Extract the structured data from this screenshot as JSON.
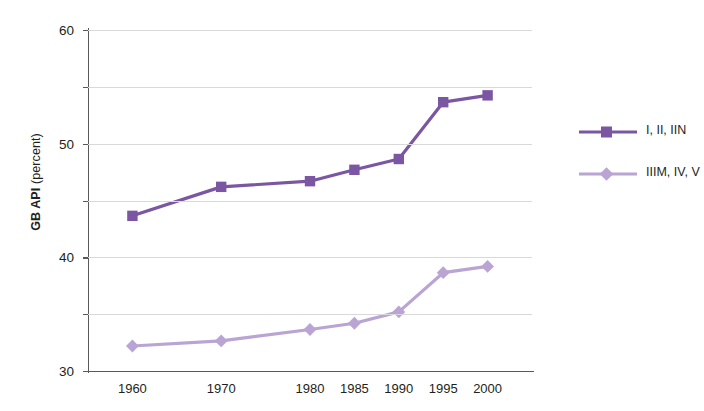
{
  "chart_data": {
    "type": "line",
    "title": "",
    "xlabel": "",
    "ylabel": "GB API (percent)",
    "ylabel_bold_part": "GB API",
    "ylabel_regular_part": " (percent)",
    "categories": [
      "1960",
      "1970",
      "1980",
      "1985",
      "1990",
      "1995",
      "2000"
    ],
    "x": [
      1960,
      1970,
      1980,
      1985,
      1990,
      1995,
      2000
    ],
    "xlim": [
      1955,
      2005
    ],
    "ylim": [
      0,
      60
    ],
    "yticks": [
      0,
      10,
      20,
      30,
      40,
      50,
      60
    ],
    "ytick_labels": [
      "0",
      "10",
      "20",
      "30",
      "40",
      "50",
      "60"
    ],
    "grid": "horizontal",
    "legend_position": "right",
    "series": [
      {
        "name": "I, II, IIN",
        "color": "#7a56a3",
        "marker": "square",
        "values": [
          27.3,
          32.4,
          33.4,
          35.4,
          37.3,
          47.3,
          48.5
        ]
      },
      {
        "name": "IIIM, IV, V",
        "color": "#b9a4d4",
        "marker": "diamond",
        "values": [
          4.4,
          5.3,
          7.3,
          8.4,
          10.4,
          17.3,
          18.4
        ]
      }
    ]
  },
  "legend": {
    "items": [
      {
        "label": "I, II, IIN"
      },
      {
        "label": "IIIM, IV, V"
      }
    ]
  },
  "colors": {
    "series_dark": "#7a56a3",
    "series_light": "#b9a4d4",
    "axis": "#58595b",
    "gridline": "#d9d9dc",
    "text": "#231f20",
    "background": "#ffffff"
  }
}
